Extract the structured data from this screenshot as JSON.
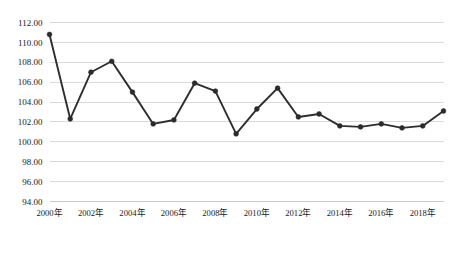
{
  "chart_data": {
    "type": "line",
    "title": "",
    "xlabel": "",
    "ylabel": "",
    "x": [
      2000,
      2001,
      2002,
      2003,
      2004,
      2005,
      2006,
      2007,
      2008,
      2009,
      2010,
      2011,
      2012,
      2013,
      2014,
      2015,
      2016,
      2017,
      2018,
      2019
    ],
    "categories": [
      "2000年",
      "2001年",
      "2002年",
      "2003年",
      "2004年",
      "2005年",
      "2006年",
      "2007年",
      "2008年",
      "2009年",
      "2010年",
      "2011年",
      "2012年",
      "2013年",
      "2014年",
      "2015年",
      "2016年",
      "2017年",
      "2018年",
      "2019年"
    ],
    "values": [
      110.8,
      102.3,
      107.0,
      108.1,
      105.0,
      101.8,
      102.2,
      105.9,
      105.1,
      100.8,
      103.3,
      105.4,
      102.5,
      102.8,
      101.6,
      101.5,
      101.8,
      101.4,
      101.6,
      103.1
    ],
    "series": [
      {
        "name": "",
        "values": [
          110.8,
          102.3,
          107.0,
          108.1,
          105.0,
          101.8,
          102.2,
          105.9,
          105.1,
          100.8,
          103.3,
          105.4,
          102.5,
          102.8,
          101.6,
          101.5,
          101.8,
          101.4,
          101.6,
          103.1
        ]
      }
    ],
    "ylim": [
      94.0,
      112.0
    ],
    "ytick_step": 2.0,
    "ytick_labels": [
      "94.00",
      "96.00",
      "98.00",
      "100.00",
      "102.00",
      "104.00",
      "106.00",
      "108.00",
      "110.00",
      "112.00"
    ],
    "xtick_labels": [
      "2000年",
      "2002年",
      "2004年",
      "2006年",
      "2008年",
      "2010年",
      "2012年",
      "2014年",
      "2016年",
      "2018年"
    ],
    "grid": true,
    "grid_axis": "y",
    "legend": false,
    "legend_position": "none",
    "marker": "circle",
    "line_color": "#2e2e2e",
    "marker_color": "#2b2b2b",
    "grid_color": "#d6d6d6",
    "background_color": "#ffffff"
  },
  "caption": {
    "text": ""
  }
}
